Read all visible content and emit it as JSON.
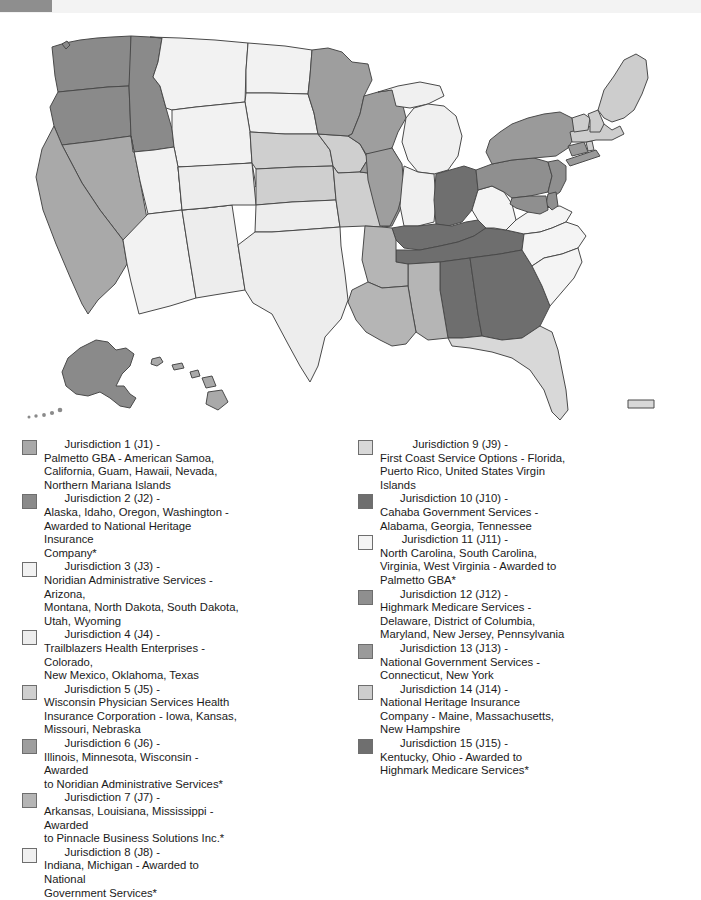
{
  "topbar": {
    "tab_color": "#8e8e8e",
    "bar_color": "#f3f3f3"
  },
  "map": {
    "title": "Medicare Administrative Contractor Jurisdictions Map",
    "type": "choropleth-united-states",
    "shades": {
      "j1": "#a9a9a9",
      "j2": "#8a8a8a",
      "j3": "#f2f2f2",
      "j4": "#ededed",
      "j5": "#cfcfcf",
      "j6": "#9e9e9e",
      "j7": "#b5b5b5",
      "j8": "#f0f0f0",
      "j9": "#d8d8d8",
      "j10": "#6e6e6e",
      "j11": "#f4f4f4",
      "j12": "#8f8f8f",
      "j13": "#9a9a9a",
      "j14": "#cdcdcd",
      "j15": "#6f6f6f"
    }
  },
  "legend": {
    "left": [
      {
        "swatch": "#a9a9a9",
        "label": "Jurisdiction 1 (J1) - ",
        "desc": "Palmetto GBA - American Samoa,\nCalifornia, Guam, Hawaii, Nevada,\nNorthern Mariana Islands"
      },
      {
        "swatch": "#8a8a8a",
        "label": "Jurisdiction 2 (J2) - ",
        "desc": "Alaska, Idaho, Oregon, Washington -\nAwarded to National Heritage Insurance\nCompany*"
      },
      {
        "swatch": "#f2f2f2",
        "label": "Jurisdiction 3 (J3) - ",
        "desc": "Noridian Administrative Services - Arizona,\nMontana, North Dakota, South Dakota,\nUtah, Wyoming"
      },
      {
        "swatch": "#ededed",
        "label": "Jurisdiction 4 (J4) - ",
        "desc": "Trailblazers Health Enterprises - Colorado,\nNew Mexico, Oklahoma, Texas"
      },
      {
        "swatch": "#cfcfcf",
        "label": "Jurisdiction 5 (J5) - ",
        "desc": "Wisconsin Physician Services Health\nInsurance Corporation - Iowa, Kansas,\nMissouri, Nebraska"
      },
      {
        "swatch": "#9e9e9e",
        "label": "Jurisdiction 6 (J6) - ",
        "desc": "Illinois, Minnesota, Wisconsin - Awarded\nto Noridian Administrative Services*"
      },
      {
        "swatch": "#b5b5b5",
        "label": "Jurisdiction 7 (J7) - ",
        "desc": "Arkansas, Louisiana, Mississippi - Awarded\nto Pinnacle Business Solutions Inc.*"
      },
      {
        "swatch": "#f0f0f0",
        "label": "Jurisdiction 8 (J8) - ",
        "desc": "Indiana, Michigan - Awarded to National\nGovernment Services*"
      }
    ],
    "right": [
      {
        "swatch": "#d8d8d8",
        "label": "Jurisdiction 9 (J9) - ",
        "desc": "First Coast Service Options - Florida,\nPuerto Rico, United States Virgin Islands"
      },
      {
        "swatch": "#6e6e6e",
        "label": "Jurisdiction 10 (J10) - ",
        "desc": "Cahaba Government Services -\nAlabama, Georgia, Tennessee"
      },
      {
        "swatch": "#f4f4f4",
        "label": "Jurisdiction 11 (J11) - ",
        "desc": "North Carolina, South Carolina,\nVirginia, West Virginia - Awarded to\nPalmetto GBA*"
      },
      {
        "swatch": "#8f8f8f",
        "label": "Jurisdiction 12 (J12) - ",
        "desc": "Highmark Medicare Services -\nDelaware, District of Columbia,\nMaryland, New Jersey, Pennsylvania"
      },
      {
        "swatch": "#9a9a9a",
        "label": "Jurisdiction 13 (J13) - ",
        "desc": "National Government Services -\nConnecticut, New York"
      },
      {
        "swatch": "#cdcdcd",
        "label": "Jurisdiction 14 (J14) - ",
        "desc": "National Heritage Insurance\nCompany - Maine, Massachusetts,\nNew Hampshire"
      },
      {
        "swatch": "#6f6f6f",
        "label": "Jurisdiction 15 (J15) - ",
        "desc": "Kentucky, Ohio - Awarded to\nHighmark Medicare Services*"
      }
    ]
  }
}
